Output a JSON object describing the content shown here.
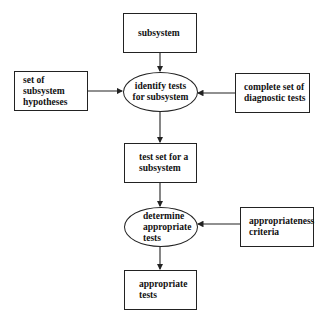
{
  "diagram": {
    "nodes": {
      "subsystem": {
        "label": "subsystem",
        "shape": "box"
      },
      "hypotheses": {
        "label": "set of subsystem\nhypotheses",
        "shape": "box"
      },
      "identify": {
        "label": "identify tests\nfor subsystem",
        "shape": "ellipse"
      },
      "diagnostic": {
        "label": "complete set of\ndiagnostic tests",
        "shape": "box"
      },
      "testset": {
        "label": "test set for a\nsubsystem",
        "shape": "box"
      },
      "determine": {
        "label": "determine\nappropriate\ntests",
        "shape": "ellipse"
      },
      "criteria": {
        "label": "appropriateness\ncriteria",
        "shape": "box"
      },
      "appropriate": {
        "label": "appropriate\ntests",
        "shape": "box"
      }
    },
    "edges": [
      {
        "from": "subsystem",
        "to": "identify"
      },
      {
        "from": "hypotheses",
        "to": "identify"
      },
      {
        "from": "diagnostic",
        "to": "identify"
      },
      {
        "from": "identify",
        "to": "testset"
      },
      {
        "from": "testset",
        "to": "determine"
      },
      {
        "from": "criteria",
        "to": "determine"
      },
      {
        "from": "determine",
        "to": "appropriate"
      }
    ]
  }
}
